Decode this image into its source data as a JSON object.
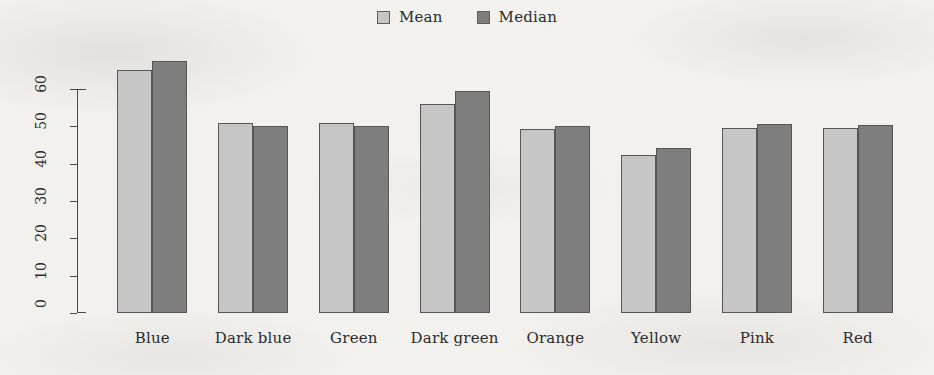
{
  "legend": {
    "position": "top-center",
    "entries": [
      {
        "label": "Mean",
        "color": "#c6c6c6",
        "icon": "square-swatch-icon"
      },
      {
        "label": "Median",
        "color": "#7e7e7e",
        "icon": "square-swatch-icon"
      }
    ]
  },
  "axis": {
    "y_ticks": [
      "0",
      "10",
      "20",
      "30",
      "40",
      "50",
      "60"
    ]
  },
  "chart_data": {
    "type": "bar",
    "title": "",
    "subtitle": "",
    "xlabel": "",
    "ylabel": "",
    "ylim": [
      0,
      60
    ],
    "grid": false,
    "legend_position": "top-center",
    "orientation": "vertical",
    "grouping": "grouped",
    "categories": [
      "Blue",
      "Dark blue",
      "Green",
      "Dark green",
      "Orange",
      "Yellow",
      "Pink",
      "Red"
    ],
    "series": [
      {
        "name": "Mean",
        "color": "#c6c6c6",
        "values": [
          65.0,
          51.0,
          51.0,
          56.0,
          49.2,
          42.2,
          49.5,
          49.5
        ]
      },
      {
        "name": "Median",
        "color": "#7e7e7e",
        "values": [
          67.5,
          50.2,
          50.2,
          59.5,
          50.2,
          44.2,
          50.5,
          50.3
        ]
      }
    ],
    "annotations": []
  }
}
